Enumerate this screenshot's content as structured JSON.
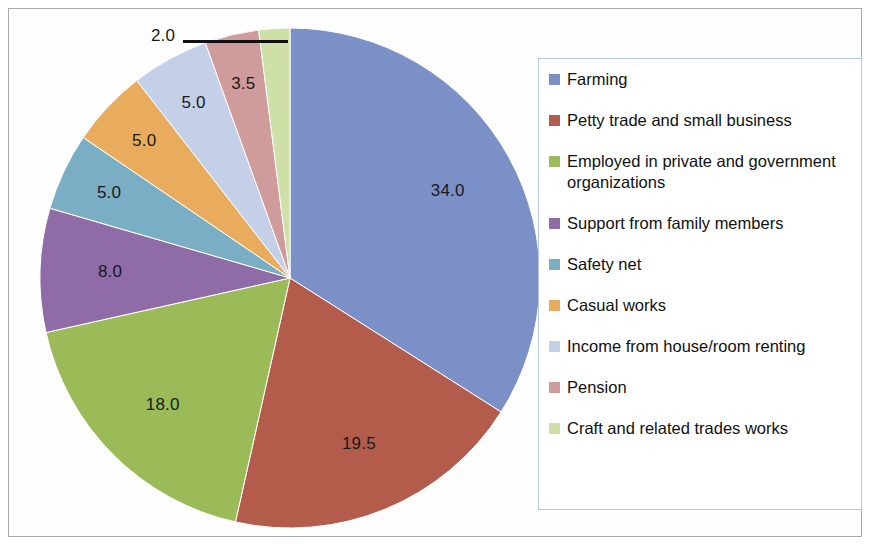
{
  "chart_data": {
    "type": "pie",
    "title": "",
    "categories": [
      "Farming",
      "Petty trade and small business",
      "Employed in private and government organizations",
      "Support from family members",
      "Safety net",
      "Casual works",
      "Income from house/room renting",
      "Pension",
      "Craft and related trades works"
    ],
    "values": [
      34.0,
      19.5,
      18.0,
      8.0,
      5.0,
      5.0,
      5.0,
      3.5,
      2.0
    ],
    "value_labels": [
      "34.0",
      "19.5",
      "18.0",
      "8.0",
      "5.0",
      "5.0",
      "5.0",
      "3.5",
      "2.0"
    ],
    "colors": [
      "#7C90C8",
      "#B35C4C",
      "#9BBB59",
      "#8F6BA8",
      "#79AEC4",
      "#E8AC5C",
      "#C4CFE8",
      "#D09B9B",
      "#CFDFA8"
    ],
    "start_angle_deg": 0,
    "direction": "clockwise",
    "total": 100,
    "legend_position": "right",
    "grid": false,
    "xlabel": "",
    "ylabel": "",
    "callout_labels": [
      "2.0"
    ]
  },
  "legend": {
    "items": [
      {
        "label": "Farming",
        "color": "#7C90C8"
      },
      {
        "label": "Petty trade and small business",
        "color": "#B35C4C"
      },
      {
        "label": "Employed in private and government organizations",
        "color": "#9BBB59"
      },
      {
        "label": "Support from family members",
        "color": "#8F6BA8"
      },
      {
        "label": "Safety net",
        "color": "#79AEC4"
      },
      {
        "label": "Casual works",
        "color": "#E8AC5C"
      },
      {
        "label": "Income from house/room renting",
        "color": "#C4CFE8"
      },
      {
        "label": "Pension",
        "color": "#D09B9B"
      },
      {
        "label": "Craft and related trades works",
        "color": "#CFDFA8"
      }
    ]
  },
  "geometry": {
    "cx": 290,
    "cy": 278,
    "r": 250,
    "label_radius_ratio": 0.72
  }
}
